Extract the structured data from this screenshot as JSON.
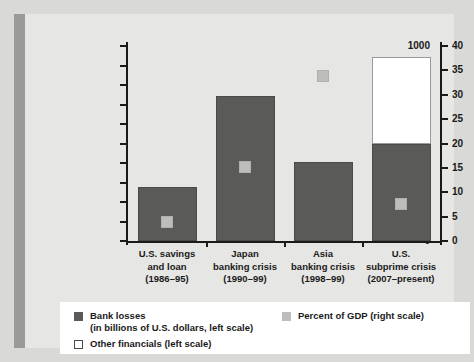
{
  "chart_data": {
    "type": "bar",
    "title": "",
    "subtitle": "",
    "xlabel": "",
    "ylabel": "",
    "categories": [
      "U.S. savings\nand loan\n(1986–95)",
      "Japan\nbanking crisis\n(1990–99)",
      "Asia\nbanking crisis\n(1998–99)",
      "U.S.\nsubprime crisis\n(2007–present)"
    ],
    "category_lines": [
      [
        "U.S. savings",
        "and loan",
        "(1986–95)"
      ],
      [
        "Japan",
        "banking crisis",
        "(1990–99)"
      ],
      [
        "Asia",
        "banking crisis",
        "(1998–99)"
      ],
      [
        "U.S.",
        "subprime crisis",
        "(2007–present)"
      ]
    ],
    "series": [
      {
        "name": "Bank losses (in billions of U.S. dollars, left scale)",
        "axis": "left",
        "type": "bar",
        "color": "#5a5a58",
        "values": [
          275,
          745,
          405,
          500
        ]
      },
      {
        "name": "Other financials (left scale)",
        "axis": "left",
        "type": "bar",
        "color": "#ffffff",
        "values": [
          0,
          0,
          0,
          445
        ]
      },
      {
        "name": "Percent of GDP (right scale)",
        "axis": "right",
        "type": "marker",
        "color": "#bdbdbb",
        "values": [
          3.8,
          15.2,
          33.8,
          7.5
        ]
      }
    ],
    "left_axis": {
      "label": "",
      "ylim": [
        0,
        1000
      ],
      "ticks": [
        0,
        100,
        200,
        300,
        400,
        500,
        600,
        700,
        800,
        900,
        1000
      ],
      "tick_labels": [
        "0",
        "100",
        "200",
        "300",
        "400",
        "500",
        "600",
        "700",
        "800",
        "900",
        "1000"
      ]
    },
    "right_axis": {
      "label": "",
      "ylim": [
        0,
        40
      ],
      "ticks": [
        0,
        5,
        10,
        15,
        20,
        25,
        30,
        35,
        40
      ],
      "tick_labels": [
        "0",
        "5",
        "10",
        "15",
        "20",
        "25",
        "30",
        "35",
        "40"
      ]
    },
    "grid": false,
    "legend_position": "bottom",
    "legend": [
      {
        "swatch": "dark-gray-square",
        "color": "#5a5a58",
        "line1": "Bank losses",
        "line2": "(in billions of U.S. dollars, left scale)"
      },
      {
        "swatch": "light-gray-square",
        "color": "#bdbdbb",
        "line1": "Percent of GDP (right scale)",
        "line2": ""
      },
      {
        "swatch": "white-square",
        "color": "#ffffff",
        "line1": "Other financials (left scale)",
        "line2": ""
      }
    ]
  },
  "colors": {
    "background": "#d9d9d7",
    "panel": "#e6e6e4",
    "spine": "#9a9a98",
    "axis": "#1a1a1a",
    "bank_losses": "#5a5a58",
    "other_financials": "#ffffff",
    "gdp_marker": "#bdbdbb",
    "legend_background": "#ffffff"
  }
}
